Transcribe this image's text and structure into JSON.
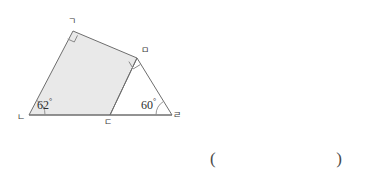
{
  "figure": {
    "type": "geometry-diagram",
    "fill_color": "#e9e9e9",
    "stroke_color": "#6e6e6e",
    "background_color": "#ffffff",
    "vertices": [
      {
        "id": "g",
        "label": "ㄱ",
        "x": 73,
        "y": 31,
        "label_x": 68,
        "label_y": 18
      },
      {
        "id": "n",
        "label": "ㄴ",
        "x": 29,
        "y": 115,
        "label_x": 18,
        "label_y": 117
      },
      {
        "id": "d",
        "label": "ㄷ",
        "x": 110,
        "y": 115,
        "label_x": 105,
        "label_y": 119
      },
      {
        "id": "r",
        "label": "ㄹ",
        "x": 172,
        "y": 115,
        "label_x": 173,
        "label_y": 114
      },
      {
        "id": "m",
        "label": "ㅁ",
        "x": 137,
        "y": 58,
        "label_x": 141,
        "label_y": 48
      }
    ],
    "polygons": [
      {
        "name": "shaded-quadrilateral",
        "points": "73,31 137,58 110,115 29,115",
        "filled": true
      },
      {
        "name": "right-triangle",
        "points": "137,58 172,115 110,115",
        "filled": false
      }
    ],
    "right_angles": [
      {
        "name": "right-angle-at-g",
        "vertex": "g",
        "size": 9
      },
      {
        "name": "right-angle-at-m",
        "vertex": "m",
        "size": 9
      }
    ],
    "angle_marks": [
      {
        "name": "angle-62",
        "vertex": "n",
        "value": "62",
        "degree_symbol": "°",
        "label_x": 37,
        "label_y": 98,
        "arc_radius": 16
      },
      {
        "name": "angle-60",
        "vertex": "r",
        "value": "60",
        "degree_symbol": "°",
        "label_x": 141,
        "label_y": 98,
        "arc_radius": 16
      }
    ]
  },
  "answer": {
    "open_paren": "(",
    "close_paren": ")",
    "value": ""
  }
}
